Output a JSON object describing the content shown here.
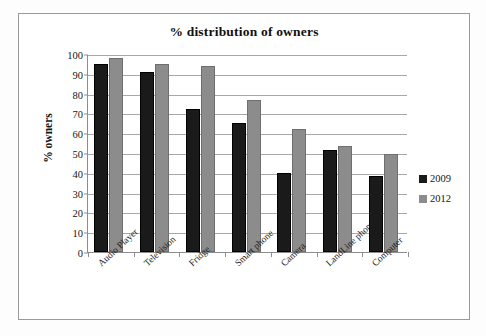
{
  "chart_data": {
    "type": "bar",
    "title": "% distribution of owners",
    "xlabel": "",
    "ylabel": "% owners",
    "ylim": [
      0,
      100
    ],
    "ytick_step": 10,
    "yticks": [
      0,
      10,
      20,
      30,
      40,
      50,
      60,
      70,
      80,
      90,
      100
    ],
    "grid": true,
    "legend_position": "right",
    "categories": [
      "Audio Player",
      "Television",
      "Fridge",
      "Smart phone",
      "Camera",
      "LandLine phones",
      "Computer"
    ],
    "series": [
      {
        "name": "2009",
        "color": "#1a1a1a",
        "values": [
          95,
          91,
          72,
          65,
          40,
          51.5,
          38.5
        ]
      },
      {
        "name": "2012",
        "color": "#8c8c8c",
        "values": [
          98,
          95,
          94,
          77,
          62,
          53.5,
          49.5
        ]
      }
    ]
  },
  "legend": {
    "entries": [
      {
        "label": "2009",
        "color": "#1a1a1a"
      },
      {
        "label": "2012",
        "color": "#8c8c8c"
      }
    ]
  }
}
